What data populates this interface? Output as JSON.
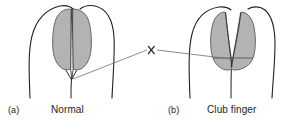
{
  "figure": {
    "width": 297,
    "height": 128,
    "background_color": "#ffffff",
    "line_color": "#231f20",
    "nail_fill_color": "#b3b3b3",
    "nail_stroke_color": "#5a5a5a",
    "pointer_line_color": "#6e6e6e"
  },
  "panels": [
    {
      "id": "a",
      "label": "(a)",
      "caption": "Normal",
      "description": "Normal finger: nail plates meet at a diamond-shaped window at the base, nail fold angle less than 180 degrees"
    },
    {
      "id": "b",
      "label": "(b)",
      "caption": "Club finger",
      "description": "Clubbed finger: nail fold angle flattened, diamond window obliterated, nail plates touch"
    }
  ],
  "annotation": {
    "marker": "x",
    "name": "window-marker",
    "description": "Leader lines from the nail base of each finger converging on the marker x between the two panels"
  }
}
